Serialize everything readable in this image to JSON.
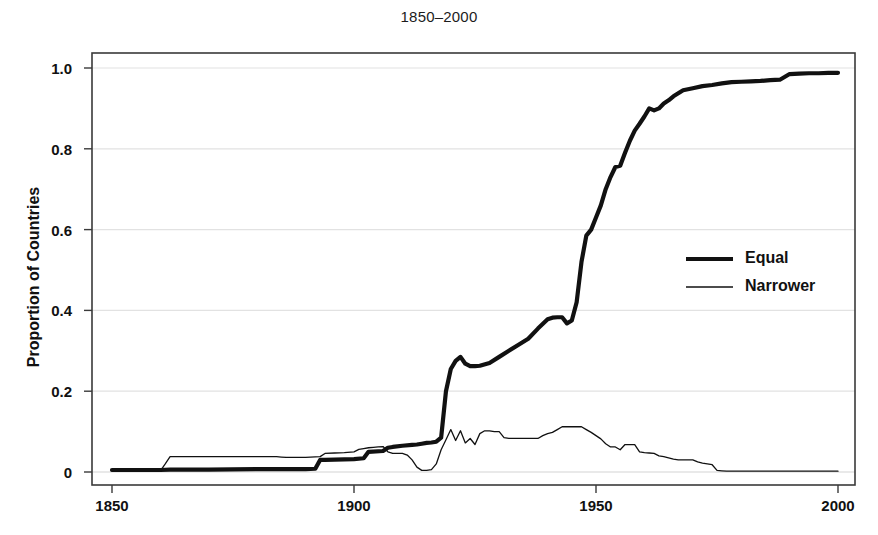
{
  "chart_data": {
    "type": "line",
    "title": "1850–2000",
    "xlabel": "",
    "ylabel": "Proportion of Countries",
    "xlim": [
      1850,
      2000
    ],
    "ylim": [
      0,
      1.0
    ],
    "xticks": [
      "1850",
      "1900",
      "1950",
      "2000"
    ],
    "xtick_values": [
      1850,
      1900,
      1950,
      2000
    ],
    "yticks": [
      "0",
      "0.2",
      "0.4",
      "0.6",
      "0.8",
      "1.0"
    ],
    "ytick_values": [
      0,
      0.2,
      0.4,
      0.6,
      0.8,
      1.0
    ],
    "grid": "horizontal",
    "legend_position": "center-right",
    "legend": [
      {
        "name": "Equal",
        "style": "thick-line",
        "color": "#111111",
        "width": 4.2
      },
      {
        "name": "Narrower",
        "style": "thin-line",
        "color": "#111111",
        "width": 1.3
      }
    ],
    "series": [
      {
        "name": "Equal",
        "x": [
          1850,
          1860,
          1862,
          1870,
          1880,
          1890,
          1892,
          1893,
          1894,
          1900,
          1902,
          1903,
          1906,
          1907,
          1908,
          1910,
          1912,
          1913,
          1914,
          1915,
          1916,
          1917,
          1918,
          1919,
          1920,
          1921,
          1922,
          1923,
          1924,
          1925,
          1926,
          1928,
          1930,
          1932,
          1934,
          1936,
          1938,
          1940,
          1941,
          1942,
          1943,
          1944,
          1945,
          1946,
          1947,
          1948,
          1949,
          1950,
          1951,
          1952,
          1953,
          1954,
          1955,
          1956,
          1957,
          1958,
          1959,
          1960,
          1961,
          1962,
          1963,
          1964,
          1965,
          1966,
          1968,
          1970,
          1972,
          1974,
          1976,
          1978,
          1980,
          1982,
          1984,
          1986,
          1988,
          1990,
          1992,
          1994,
          1996,
          1998,
          2000
        ],
        "y": [
          0.005,
          0.005,
          0.006,
          0.006,
          0.007,
          0.007,
          0.008,
          0.03,
          0.03,
          0.032,
          0.034,
          0.05,
          0.052,
          0.06,
          0.062,
          0.065,
          0.067,
          0.068,
          0.07,
          0.072,
          0.073,
          0.075,
          0.085,
          0.2,
          0.255,
          0.275,
          0.285,
          0.268,
          0.262,
          0.262,
          0.263,
          0.27,
          0.285,
          0.3,
          0.315,
          0.33,
          0.355,
          0.378,
          0.382,
          0.383,
          0.383,
          0.368,
          0.375,
          0.42,
          0.52,
          0.585,
          0.6,
          0.63,
          0.66,
          0.7,
          0.73,
          0.755,
          0.758,
          0.79,
          0.82,
          0.845,
          0.862,
          0.88,
          0.9,
          0.895,
          0.9,
          0.912,
          0.92,
          0.93,
          0.945,
          0.95,
          0.955,
          0.958,
          0.962,
          0.965,
          0.966,
          0.967,
          0.968,
          0.97,
          0.971,
          0.985,
          0.986,
          0.987,
          0.987,
          0.988,
          0.988
        ]
      },
      {
        "name": "Narrower",
        "x": [
          1850,
          1858,
          1860,
          1861,
          1862,
          1863,
          1870,
          1880,
          1884,
          1885,
          1886,
          1890,
          1893,
          1894,
          1896,
          1898,
          1900,
          1901,
          1902,
          1903,
          1904,
          1905,
          1906,
          1907,
          1908,
          1910,
          1911,
          1912,
          1913,
          1914,
          1915,
          1916,
          1917,
          1918,
          1919,
          1920,
          1921,
          1922,
          1923,
          1924,
          1925,
          1926,
          1927,
          1928,
          1929,
          1930,
          1931,
          1932,
          1934,
          1936,
          1938,
          1939,
          1940,
          1941,
          1942,
          1943,
          1944,
          1945,
          1946,
          1947,
          1948,
          1949,
          1950,
          1951,
          1952,
          1953,
          1954,
          1955,
          1956,
          1957,
          1958,
          1959,
          1960,
          1961,
          1962,
          1963,
          1964,
          1965,
          1966,
          1967,
          1968,
          1970,
          1971,
          1972,
          1973,
          1974,
          1975,
          1976,
          1977,
          1978,
          1980,
          1985,
          1990,
          1995,
          2000
        ],
        "y": [
          0.002,
          0.002,
          0.003,
          0.02,
          0.038,
          0.038,
          0.038,
          0.038,
          0.038,
          0.037,
          0.036,
          0.036,
          0.038,
          0.046,
          0.047,
          0.048,
          0.05,
          0.056,
          0.058,
          0.06,
          0.061,
          0.062,
          0.063,
          0.05,
          0.046,
          0.046,
          0.042,
          0.03,
          0.012,
          0.004,
          0.004,
          0.006,
          0.02,
          0.055,
          0.08,
          0.105,
          0.078,
          0.102,
          0.072,
          0.083,
          0.068,
          0.095,
          0.102,
          0.102,
          0.1,
          0.1,
          0.085,
          0.083,
          0.083,
          0.083,
          0.083,
          0.09,
          0.095,
          0.098,
          0.105,
          0.112,
          0.112,
          0.112,
          0.112,
          0.112,
          0.105,
          0.098,
          0.09,
          0.082,
          0.07,
          0.062,
          0.062,
          0.055,
          0.068,
          0.068,
          0.068,
          0.05,
          0.048,
          0.047,
          0.046,
          0.04,
          0.038,
          0.035,
          0.032,
          0.03,
          0.03,
          0.03,
          0.025,
          0.022,
          0.02,
          0.018,
          0.004,
          0.003,
          0.002,
          0.002,
          0.002,
          0.002,
          0.002,
          0.002,
          0.002
        ]
      }
    ]
  },
  "axes": {
    "plot_box": {
      "left": 92,
      "top": 53,
      "right": 855,
      "bottom": 485
    },
    "x_pixel_at_1850": 112,
    "x_pixel_at_2000": 838,
    "y_pixel_at_0": 472,
    "y_pixel_at_1": 68,
    "grid_color": "#e2e2e2",
    "frame_color": "#3a3a3a",
    "background": "#ffffff"
  },
  "legend_box": {
    "x": 686,
    "y_equal": 259,
    "y_narrower": 287,
    "line_x0": 686,
    "line_x1": 733
  }
}
